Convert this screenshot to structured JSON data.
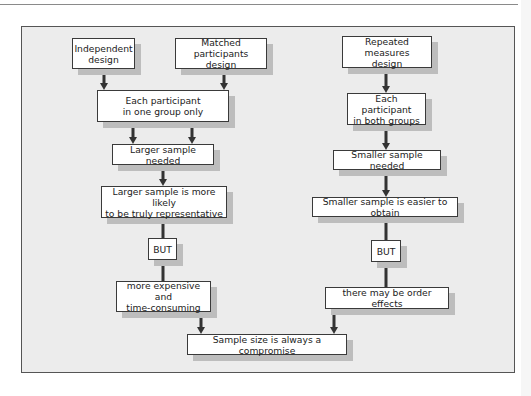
{
  "diagram": {
    "type": "flowchart",
    "left_branch": {
      "start_nodes": [
        {
          "id": "independent",
          "label": "Independent\ndesign"
        },
        {
          "id": "matched",
          "label": "Matched participants\ndesign"
        }
      ],
      "steps": [
        {
          "id": "one-group",
          "label": "Each participant\nin one group only"
        },
        {
          "id": "larger-needed",
          "label": "Larger sample needed"
        },
        {
          "id": "larger-representative",
          "label": "Larger sample is more likely\nto be truly representative"
        },
        {
          "id": "but-left",
          "label": "BUT"
        },
        {
          "id": "expensive",
          "label": "more expensive and\ntime-consuming"
        }
      ]
    },
    "right_branch": {
      "start_nodes": [
        {
          "id": "repeated",
          "label": "Repeated measures\ndesign"
        }
      ],
      "steps": [
        {
          "id": "both-groups",
          "label": "Each participant\nin both groups"
        },
        {
          "id": "smaller-needed",
          "label": "Smaller sample needed"
        },
        {
          "id": "smaller-easier",
          "label": "Smaller sample is easier to obtain"
        },
        {
          "id": "but-right",
          "label": "BUT"
        },
        {
          "id": "order-effects",
          "label": "there may be order effects"
        }
      ]
    },
    "conclusion": {
      "id": "compromise",
      "label": "Sample size is always a compromise"
    },
    "colors": {
      "frame_bg": "#ececec",
      "box_bg": "#ffffff",
      "box_border": "#3a3a3a",
      "shadow": "#bdbdbd",
      "arrow": "#333333"
    }
  }
}
